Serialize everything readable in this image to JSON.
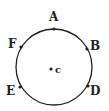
{
  "diagram": {
    "type": "circle-with-labeled-points",
    "stroke_color": "#222222",
    "background": "#ffffff",
    "circle": {
      "cx": 54,
      "cy": 67,
      "r": 38
    },
    "center": {
      "label": "c",
      "x": 51,
      "y": 69,
      "label_x": 55,
      "label_y": 73
    },
    "points": [
      {
        "id": "A",
        "label": "A",
        "x": 54,
        "y": 29,
        "label_x": 49,
        "label_y": 21
      },
      {
        "id": "B",
        "label": "B",
        "x": 87,
        "y": 49,
        "label_x": 90,
        "label_y": 50
      },
      {
        "id": "D",
        "label": "D",
        "x": 88,
        "y": 86,
        "label_x": 90,
        "label_y": 95
      },
      {
        "id": "E",
        "label": "E",
        "x": 20,
        "y": 87,
        "label_x": 6,
        "label_y": 95
      },
      {
        "id": "F",
        "label": "F",
        "x": 21,
        "y": 47,
        "label_x": 8,
        "label_y": 48
      }
    ]
  }
}
